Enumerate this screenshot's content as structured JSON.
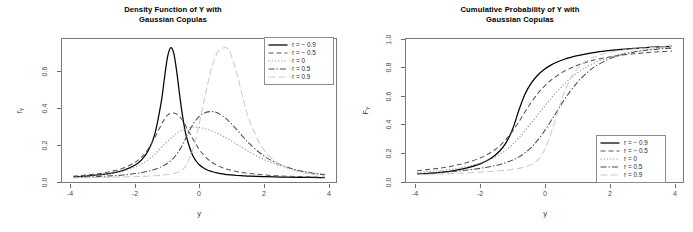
{
  "figure": {
    "background": "#ffffff",
    "panels": [
      "density",
      "cdf"
    ]
  },
  "panels": {
    "density": {
      "title_line1": "Density Function of Y with",
      "title_line2": "Gaussian Copulas",
      "xlabel": "y",
      "ylabel_base": "f",
      "ylabel_sub": "Y",
      "xticks": [
        "-4",
        "-2",
        "0",
        "2",
        "4"
      ],
      "yticks": [
        "0.0",
        "0.2",
        "0.4",
        "0.6"
      ]
    },
    "cdf": {
      "title_line1": "Cumulative Probability of Y with",
      "title_line2": "Gaussian Copulas",
      "xlabel": "y",
      "ylabel_base": "F",
      "ylabel_sub": "Y",
      "xticks": [
        "-4",
        "-2",
        "0",
        "2",
        "4"
      ],
      "yticks": [
        "0.0",
        "0.2",
        "0.4",
        "0.6",
        "0.8",
        "1.0"
      ]
    }
  },
  "legend": {
    "items": [
      {
        "label": "r = − 0.9",
        "style": "solid",
        "color": "#000000"
      },
      {
        "label": "r = − 0.5",
        "style": "dashed",
        "color": "#555555"
      },
      {
        "label": "r = 0",
        "style": "dotted",
        "color": "#8f8f8f"
      },
      {
        "label": "r = 0.5",
        "style": "dashdot",
        "color": "#4d4d4d"
      },
      {
        "label": "r = 0.9",
        "style": "longdash",
        "color": "#cccccc"
      }
    ]
  },
  "chart_data": [
    {
      "type": "line",
      "title": "Density Function of Y with Gaussian Copulas",
      "xlabel": "y",
      "ylabel": "f_Y",
      "xlim": [
        -4.35,
        4.35
      ],
      "ylim": [
        -0.012,
        0.78
      ],
      "xticks": [
        -4,
        -2,
        0,
        2,
        4
      ],
      "yticks": [
        0.0,
        0.2,
        0.4,
        0.6
      ],
      "grid": false,
      "legend_position": "top-right",
      "x": [
        -4.0,
        -3.6,
        -3.2,
        -2.8,
        -2.4,
        -2.0,
        -1.8,
        -1.6,
        -1.4,
        -1.2,
        -1.1,
        -1.0,
        -0.9,
        -0.8,
        -0.7,
        -0.6,
        -0.5,
        -0.4,
        -0.2,
        0.0,
        0.2,
        0.4,
        0.6,
        0.8,
        0.9,
        1.0,
        1.2,
        1.4,
        1.6,
        2.0,
        2.4,
        2.8,
        3.2,
        3.6,
        4.0
      ],
      "series": [
        {
          "name": "r = -0.9",
          "style": "solid",
          "color": "#000000",
          "values": [
            0.017,
            0.021,
            0.027,
            0.036,
            0.052,
            0.085,
            0.115,
            0.165,
            0.255,
            0.43,
            0.56,
            0.68,
            0.732,
            0.7,
            0.59,
            0.45,
            0.33,
            0.24,
            0.135,
            0.085,
            0.06,
            0.046,
            0.037,
            0.031,
            0.029,
            0.027,
            0.024,
            0.022,
            0.02,
            0.018,
            0.016,
            0.015,
            0.014,
            0.013,
            0.012
          ]
        },
        {
          "name": "r = -0.5",
          "style": "dashed",
          "color": "#555555",
          "values": [
            0.02,
            0.026,
            0.034,
            0.046,
            0.065,
            0.1,
            0.13,
            0.175,
            0.235,
            0.305,
            0.335,
            0.358,
            0.368,
            0.37,
            0.363,
            0.347,
            0.323,
            0.292,
            0.228,
            0.17,
            0.128,
            0.098,
            0.078,
            0.064,
            0.058,
            0.054,
            0.046,
            0.04,
            0.035,
            0.028,
            0.023,
            0.02,
            0.018,
            0.016,
            0.014
          ]
        },
        {
          "name": "r = 0",
          "style": "dotted",
          "color": "#8f8f8f",
          "values": [
            0.016,
            0.02,
            0.026,
            0.035,
            0.049,
            0.072,
            0.09,
            0.113,
            0.143,
            0.178,
            0.196,
            0.214,
            0.23,
            0.245,
            0.258,
            0.27,
            0.278,
            0.285,
            0.292,
            0.29,
            0.283,
            0.272,
            0.256,
            0.238,
            0.228,
            0.218,
            0.197,
            0.176,
            0.155,
            0.118,
            0.089,
            0.067,
            0.051,
            0.04,
            0.031
          ]
        },
        {
          "name": "r = 0.5",
          "style": "dashdot",
          "color": "#4d4d4d",
          "values": [
            0.013,
            0.015,
            0.018,
            0.022,
            0.027,
            0.035,
            0.041,
            0.048,
            0.058,
            0.072,
            0.081,
            0.092,
            0.105,
            0.122,
            0.143,
            0.17,
            0.202,
            0.238,
            0.305,
            0.35,
            0.372,
            0.378,
            0.37,
            0.348,
            0.333,
            0.316,
            0.278,
            0.238,
            0.2,
            0.14,
            0.098,
            0.07,
            0.05,
            0.037,
            0.028
          ]
        },
        {
          "name": "r = 0.9",
          "style": "longdash",
          "color": "#cccccc",
          "values": [
            0.011,
            0.012,
            0.013,
            0.014,
            0.016,
            0.018,
            0.019,
            0.021,
            0.023,
            0.025,
            0.027,
            0.029,
            0.031,
            0.035,
            0.04,
            0.047,
            0.06,
            0.083,
            0.165,
            0.305,
            0.47,
            0.62,
            0.71,
            0.732,
            0.728,
            0.7,
            0.59,
            0.45,
            0.33,
            0.18,
            0.105,
            0.065,
            0.044,
            0.031,
            0.023
          ]
        }
      ]
    },
    {
      "type": "line",
      "title": "Cumulative Probability of Y with Gaussian Copulas",
      "xlabel": "y",
      "ylabel": "F_Y",
      "xlim": [
        -4.35,
        4.35
      ],
      "ylim": [
        -0.02,
        1.02
      ],
      "xticks": [
        -4,
        -2,
        0,
        2,
        4
      ],
      "yticks": [
        0.0,
        0.2,
        0.4,
        0.6,
        0.8,
        1.0
      ],
      "grid": false,
      "legend_position": "bottom-right",
      "x": [
        -4.0,
        -3.6,
        -3.2,
        -2.8,
        -2.4,
        -2.0,
        -1.8,
        -1.6,
        -1.4,
        -1.2,
        -1.0,
        -0.8,
        -0.6,
        -0.4,
        -0.2,
        0.0,
        0.2,
        0.4,
        0.6,
        0.8,
        1.0,
        1.2,
        1.4,
        1.6,
        2.0,
        2.4,
        2.8,
        3.2,
        3.6,
        4.0
      ],
      "series": [
        {
          "name": "r = -0.9",
          "style": "solid",
          "color": "#000000",
          "values": [
            0.036,
            0.043,
            0.052,
            0.065,
            0.084,
            0.114,
            0.136,
            0.166,
            0.207,
            0.268,
            0.365,
            0.505,
            0.625,
            0.705,
            0.76,
            0.8,
            0.83,
            0.853,
            0.871,
            0.885,
            0.897,
            0.907,
            0.916,
            0.923,
            0.935,
            0.944,
            0.952,
            0.958,
            0.963,
            0.967
          ]
        },
        {
          "name": "r = -0.5",
          "style": "dashed",
          "color": "#555555",
          "values": [
            0.062,
            0.072,
            0.084,
            0.101,
            0.124,
            0.157,
            0.18,
            0.208,
            0.245,
            0.292,
            0.35,
            0.42,
            0.495,
            0.565,
            0.627,
            0.678,
            0.72,
            0.754,
            0.783,
            0.806,
            0.826,
            0.843,
            0.857,
            0.869,
            0.888,
            0.902,
            0.912,
            0.921,
            0.927,
            0.932
          ]
        },
        {
          "name": "r = 0",
          "style": "dotted",
          "color": "#8f8f8f",
          "values": [
            0.049,
            0.056,
            0.065,
            0.077,
            0.094,
            0.118,
            0.134,
            0.155,
            0.181,
            0.213,
            0.255,
            0.302,
            0.357,
            0.414,
            0.472,
            0.53,
            0.587,
            0.64,
            0.688,
            0.731,
            0.768,
            0.8,
            0.827,
            0.85,
            0.885,
            0.91,
            0.928,
            0.941,
            0.95,
            0.957
          ]
        },
        {
          "name": "r = 0.5",
          "style": "dashdot",
          "color": "#4d4d4d",
          "values": [
            0.04,
            0.045,
            0.051,
            0.058,
            0.068,
            0.08,
            0.088,
            0.097,
            0.108,
            0.122,
            0.14,
            0.163,
            0.194,
            0.235,
            0.288,
            0.352,
            0.423,
            0.497,
            0.57,
            0.637,
            0.696,
            0.746,
            0.788,
            0.822,
            0.872,
            0.904,
            0.924,
            0.938,
            0.947,
            0.954
          ]
        },
        {
          "name": "r = 0.9",
          "style": "longdash",
          "color": "#cccccc",
          "values": [
            0.033,
            0.036,
            0.039,
            0.043,
            0.047,
            0.052,
            0.055,
            0.058,
            0.062,
            0.066,
            0.072,
            0.079,
            0.09,
            0.108,
            0.143,
            0.212,
            0.33,
            0.48,
            0.62,
            0.725,
            0.795,
            0.842,
            0.872,
            0.893,
            0.92,
            0.936,
            0.947,
            0.955,
            0.961,
            0.966
          ]
        }
      ]
    }
  ]
}
